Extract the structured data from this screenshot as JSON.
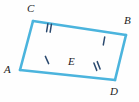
{
  "figure": {
    "name": "bowtie-triangles-diagram",
    "background_color": "#fefefe",
    "stroke_color": "#4BB4DD",
    "tick_color": "#2B4A6F",
    "label_color": "#1c1c1c",
    "stroke_width": 2.6,
    "width": 139,
    "height": 102
  },
  "vertices": [
    {
      "id": "A",
      "label": "A",
      "x": 20,
      "y": 70,
      "label_x": 4,
      "label_y": 64
    },
    {
      "id": "C",
      "label": "C",
      "x": 33,
      "y": 21,
      "label_x": 27,
      "label_y": 3
    },
    {
      "id": "E",
      "label": "E",
      "x": 76,
      "y": 53,
      "label_x": 68,
      "label_y": 56
    },
    {
      "id": "B",
      "label": "B",
      "x": 126,
      "y": 35,
      "label_x": 124,
      "label_y": 15
    },
    {
      "id": "D",
      "label": "D",
      "x": 115,
      "y": 80,
      "label_x": 110,
      "label_y": 86
    }
  ],
  "segments": [
    {
      "id": "AC",
      "from": "A",
      "to": "C",
      "x1": 20,
      "y1": 70,
      "x2": 33,
      "y2": 21,
      "ticks": 0
    },
    {
      "id": "CB",
      "from": "C",
      "to": "B",
      "x1": 33,
      "y1": 21,
      "x2": 126,
      "y2": 35,
      "ticks": 0
    },
    {
      "id": "AD",
      "from": "A",
      "to": "D",
      "x1": 20,
      "y1": 70,
      "x2": 115,
      "y2": 80,
      "ticks": 0
    },
    {
      "id": "BD",
      "from": "B",
      "to": "D",
      "x1": 126,
      "y1": 35,
      "x2": 115,
      "y2": 80,
      "ticks": 0
    }
  ],
  "tick_marks": [
    {
      "id": "tick-CE",
      "on_segment": "CE",
      "count": 2,
      "x": 49,
      "y": 28,
      "angle": 9
    },
    {
      "id": "tick-AE",
      "on_segment": "AE",
      "count": 1,
      "x": 47,
      "y": 60,
      "angle": -24
    },
    {
      "id": "tick-EB",
      "on_segment": "EB",
      "count": 1,
      "x": 104,
      "y": 41,
      "angle": 10
    },
    {
      "id": "tick-ED",
      "on_segment": "ED",
      "count": 2,
      "x": 97,
      "y": 66,
      "angle": -21
    }
  ]
}
